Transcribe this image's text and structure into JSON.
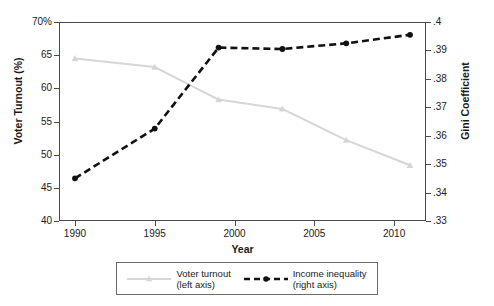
{
  "chart_data": {
    "type": "line",
    "title": "",
    "xlabel": "Year",
    "ylabel": "Voter Turnout (%)",
    "ylabel_right": "Gini Coefficient",
    "x": [
      1990,
      1995,
      1999,
      2003,
      2007,
      2011
    ],
    "xlim": [
      1989,
      2012
    ],
    "ylim": [
      40,
      70
    ],
    "ylim_right": [
      0.33,
      0.4
    ],
    "grid": false,
    "legend_position": "bottom-outside",
    "xticks": [
      "1990",
      "1995",
      "2000",
      "2005",
      "2010"
    ],
    "xtick_values": [
      1990,
      1995,
      2000,
      2005,
      2010
    ],
    "yticks_left": [
      "40",
      "45",
      "50",
      "55",
      "60",
      "65",
      "70%"
    ],
    "ytick_values_left": [
      40,
      45,
      50,
      55,
      60,
      65,
      70
    ],
    "yticks_right": [
      ".33",
      ".34",
      ".35",
      ".36",
      ".37",
      ".38",
      ".39",
      ".4"
    ],
    "ytick_values_right": [
      0.33,
      0.34,
      0.35,
      0.36,
      0.37,
      0.38,
      0.39,
      0.4
    ],
    "series": [
      {
        "name": "Voter turnout",
        "axis": "left",
        "legend_label_line1": "Voter turnout",
        "legend_label_line2": "(left axis)",
        "color": "#d6d6d6",
        "marker": "triangle",
        "linestyle": "solid",
        "values": [
          64.5,
          63.2,
          58.3,
          56.9,
          52.2,
          48.4
        ]
      },
      {
        "name": "Income inequality",
        "axis": "right",
        "legend_label_line1": "Income inequality",
        "legend_label_line2": "(right axis)",
        "color": "#111111",
        "marker": "circle",
        "linestyle": "dashed",
        "values": [
          0.345,
          0.3625,
          0.391,
          0.3905,
          0.3925,
          0.3955
        ]
      }
    ]
  }
}
